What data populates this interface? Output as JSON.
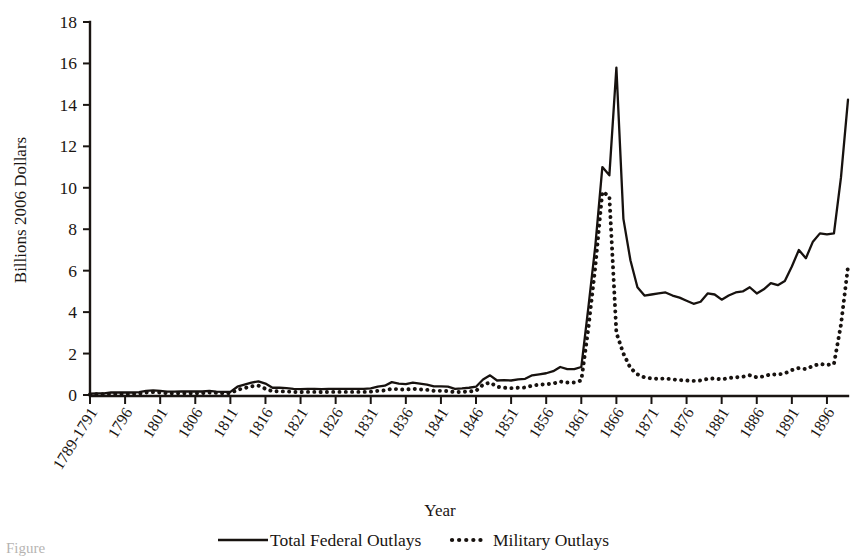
{
  "chart_data": {
    "type": "line",
    "title": "",
    "xlabel": "Year",
    "ylabel": "Billions 2006 Dollars",
    "ylim": [
      0,
      18
    ],
    "yticks": [
      0,
      2,
      4,
      6,
      8,
      10,
      12,
      14,
      16,
      18
    ],
    "grid": false,
    "legend_position": "bottom",
    "xtick_labels": [
      "1789-1791",
      "1796",
      "1801",
      "1806",
      "1811",
      "1816",
      "1821",
      "1826",
      "1831",
      "1836",
      "1841",
      "1846",
      "1851",
      "1856",
      "1861",
      "1866",
      "1871",
      "1876",
      "1881",
      "1886",
      "1891",
      "1896"
    ],
    "xtick_years": [
      1791,
      1796,
      1801,
      1806,
      1811,
      1816,
      1821,
      1826,
      1831,
      1836,
      1841,
      1846,
      1851,
      1856,
      1861,
      1866,
      1871,
      1876,
      1881,
      1886,
      1891,
      1896
    ],
    "x_start_year": 1791,
    "x_end_year": 1899,
    "series": [
      {
        "name": "Total Federal Outlays",
        "style": "solid",
        "color": "#17120f",
        "x": [
          1791,
          1792,
          1793,
          1794,
          1795,
          1796,
          1797,
          1798,
          1799,
          1800,
          1801,
          1802,
          1803,
          1804,
          1805,
          1806,
          1807,
          1808,
          1809,
          1810,
          1811,
          1812,
          1813,
          1814,
          1815,
          1816,
          1817,
          1818,
          1819,
          1820,
          1821,
          1822,
          1823,
          1824,
          1825,
          1826,
          1827,
          1828,
          1829,
          1830,
          1831,
          1832,
          1833,
          1834,
          1835,
          1836,
          1837,
          1838,
          1839,
          1840,
          1841,
          1842,
          1843,
          1844,
          1845,
          1846,
          1847,
          1848,
          1849,
          1850,
          1851,
          1852,
          1853,
          1854,
          1855,
          1856,
          1857,
          1858,
          1859,
          1860,
          1861,
          1862,
          1863,
          1864,
          1865,
          1866,
          1867,
          1868,
          1869,
          1870,
          1871,
          1872,
          1873,
          1874,
          1875,
          1876,
          1877,
          1878,
          1879,
          1880,
          1881,
          1882,
          1883,
          1884,
          1885,
          1886,
          1887,
          1888,
          1889,
          1890,
          1891,
          1892,
          1893,
          1894,
          1895,
          1896,
          1897,
          1898,
          1899
        ],
        "values": [
          0.06,
          0.08,
          0.08,
          0.12,
          0.13,
          0.12,
          0.12,
          0.14,
          0.2,
          0.22,
          0.2,
          0.16,
          0.16,
          0.17,
          0.17,
          0.17,
          0.17,
          0.2,
          0.16,
          0.15,
          0.15,
          0.4,
          0.5,
          0.6,
          0.66,
          0.55,
          0.35,
          0.35,
          0.33,
          0.3,
          0.28,
          0.3,
          0.3,
          0.28,
          0.3,
          0.3,
          0.3,
          0.3,
          0.3,
          0.3,
          0.32,
          0.4,
          0.45,
          0.62,
          0.55,
          0.52,
          0.6,
          0.55,
          0.5,
          0.42,
          0.42,
          0.4,
          0.3,
          0.32,
          0.35,
          0.4,
          0.75,
          0.95,
          0.7,
          0.72,
          0.7,
          0.75,
          0.78,
          0.95,
          1.0,
          1.05,
          1.15,
          1.35,
          1.25,
          1.25,
          1.35,
          4.2,
          7.2,
          11.0,
          10.6,
          15.8,
          8.5,
          6.5,
          5.2,
          4.8,
          4.85,
          4.9,
          4.95,
          4.8,
          4.7,
          4.55,
          4.4,
          4.5,
          4.9,
          4.85,
          4.6,
          4.8,
          4.95,
          5.0,
          5.2,
          4.9,
          5.1,
          5.4,
          5.3,
          5.5,
          6.2,
          7.0,
          6.6,
          7.4,
          7.8,
          7.75,
          7.8,
          10.5,
          14.25
        ]
      },
      {
        "name": "Military Outlays",
        "style": "dotted",
        "color": "#17120f",
        "x": [
          1791,
          1792,
          1793,
          1794,
          1795,
          1796,
          1797,
          1798,
          1799,
          1800,
          1801,
          1802,
          1803,
          1804,
          1805,
          1806,
          1807,
          1808,
          1809,
          1810,
          1811,
          1812,
          1813,
          1814,
          1815,
          1816,
          1817,
          1818,
          1819,
          1820,
          1821,
          1822,
          1823,
          1824,
          1825,
          1826,
          1827,
          1828,
          1829,
          1830,
          1831,
          1832,
          1833,
          1834,
          1835,
          1836,
          1837,
          1838,
          1839,
          1840,
          1841,
          1842,
          1843,
          1844,
          1845,
          1846,
          1847,
          1848,
          1849,
          1850,
          1851,
          1852,
          1853,
          1854,
          1855,
          1856,
          1857,
          1858,
          1859,
          1860,
          1861,
          1862,
          1863,
          1864,
          1865,
          1866,
          1867,
          1868,
          1869,
          1870,
          1871,
          1872,
          1873,
          1874,
          1875,
          1876,
          1877,
          1878,
          1879,
          1880,
          1881,
          1882,
          1883,
          1884,
          1885,
          1886,
          1887,
          1888,
          1889,
          1890,
          1891,
          1892,
          1893,
          1894,
          1895,
          1896,
          1897,
          1898,
          1899
        ],
        "values": [
          0.03,
          0.04,
          0.04,
          0.05,
          0.06,
          0.05,
          0.05,
          0.07,
          0.12,
          0.14,
          0.12,
          0.08,
          0.08,
          0.08,
          0.08,
          0.08,
          0.09,
          0.12,
          0.1,
          0.09,
          0.09,
          0.25,
          0.33,
          0.42,
          0.45,
          0.3,
          0.18,
          0.18,
          0.17,
          0.15,
          0.14,
          0.15,
          0.15,
          0.14,
          0.15,
          0.15,
          0.15,
          0.15,
          0.15,
          0.15,
          0.16,
          0.2,
          0.22,
          0.3,
          0.27,
          0.26,
          0.3,
          0.27,
          0.25,
          0.2,
          0.2,
          0.19,
          0.14,
          0.15,
          0.17,
          0.2,
          0.5,
          0.6,
          0.4,
          0.35,
          0.33,
          0.35,
          0.36,
          0.45,
          0.5,
          0.52,
          0.55,
          0.65,
          0.6,
          0.6,
          0.7,
          3.2,
          6.2,
          9.8,
          9.6,
          3.0,
          2.0,
          1.3,
          1.0,
          0.85,
          0.8,
          0.78,
          0.8,
          0.75,
          0.72,
          0.7,
          0.68,
          0.7,
          0.78,
          0.8,
          0.75,
          0.82,
          0.85,
          0.88,
          0.95,
          0.85,
          0.9,
          1.0,
          0.98,
          1.05,
          1.2,
          1.3,
          1.25,
          1.4,
          1.5,
          1.45,
          1.5,
          3.4,
          6.2
        ]
      }
    ]
  },
  "axes": {
    "y_title": "Billions 2006 Dollars",
    "x_title": "Year"
  },
  "legend": {
    "items": [
      {
        "label": "Total Federal Outlays",
        "marker": "solid-line"
      },
      {
        "label": "Military Outlays",
        "marker": "dotted-line"
      }
    ]
  },
  "caption": {
    "text": "Figure"
  }
}
